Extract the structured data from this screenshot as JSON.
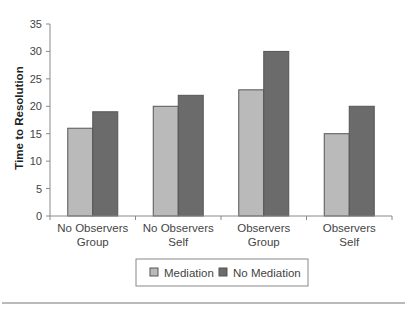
{
  "chart_data": {
    "type": "bar",
    "title": "",
    "xlabel": "",
    "ylabel": "Time to Resolution",
    "ylim": [
      0,
      35
    ],
    "yticks": [
      0,
      5,
      10,
      15,
      20,
      25,
      30,
      35
    ],
    "grid": false,
    "legend_position": "bottom",
    "categories": [
      [
        "No Observers",
        "Group"
      ],
      [
        "No Observers",
        "Self"
      ],
      [
        "Observers",
        "Group"
      ],
      [
        "Observers",
        "Self"
      ]
    ],
    "series": [
      {
        "name": "Mediation",
        "color": "#bababa",
        "values": [
          16,
          20,
          23,
          15
        ]
      },
      {
        "name": "No Mediation",
        "color": "#6b6b6b",
        "values": [
          19,
          22,
          30,
          20
        ]
      }
    ]
  },
  "colors": {
    "axis": "#8a8a8a",
    "bar_border": "#555555",
    "legend_border": "#888888",
    "rule": "#777777"
  }
}
